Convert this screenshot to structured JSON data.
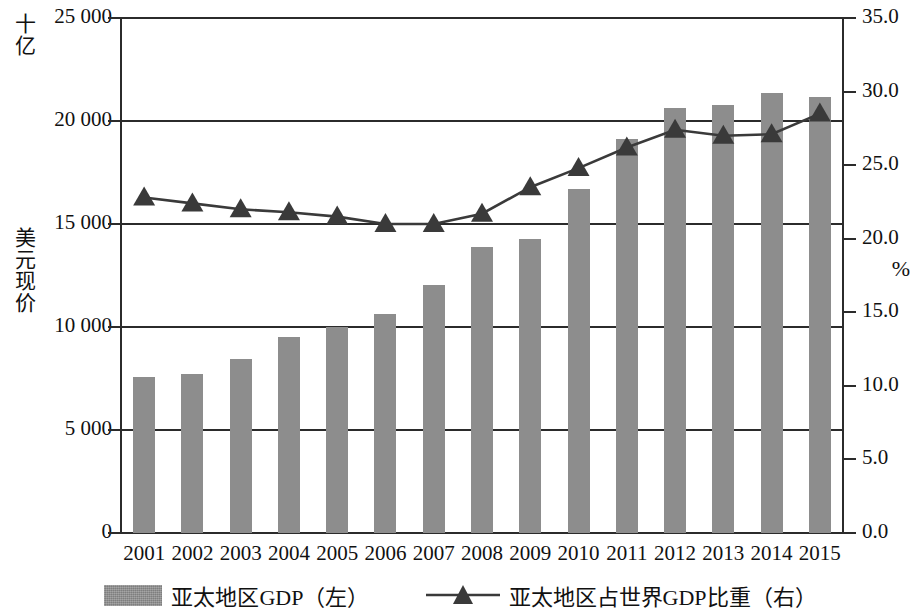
{
  "chart_data": {
    "type": "bar",
    "title": "",
    "xlabel": "",
    "categories": [
      "2001",
      "2002",
      "2003",
      "2004",
      "2005",
      "2006",
      "2007",
      "2008",
      "2009",
      "2010",
      "2011",
      "2012",
      "2013",
      "2014",
      "2015"
    ],
    "grid": true,
    "legend_position": "bottom",
    "left_axis": {
      "unit_top": "十亿",
      "unit_mid": "美元现价",
      "ylim": [
        0,
        25000
      ],
      "tick_values": [
        0,
        5000,
        10000,
        15000,
        20000,
        25000
      ],
      "tick_labels": [
        "0",
        "5 000",
        "10 000",
        "15 000",
        "20 000",
        "25 000"
      ]
    },
    "right_axis": {
      "unit": "%",
      "ylim": [
        0.0,
        35.0
      ],
      "tick_values": [
        0.0,
        5.0,
        10.0,
        15.0,
        20.0,
        25.0,
        30.0,
        35.0
      ],
      "tick_labels": [
        "0.0",
        "5.0",
        "10.0",
        "15.0",
        "20.0",
        "25.0",
        "30.0",
        "35.0"
      ]
    },
    "series": [
      {
        "name": "亚太地区GDP（左）",
        "type": "bar",
        "axis": "left",
        "color": "#8d8d8d",
        "values": [
          7570,
          7700,
          8450,
          9500,
          10000,
          10650,
          12050,
          13900,
          14250,
          16700,
          19150,
          20650,
          20800,
          21350,
          21150
        ]
      },
      {
        "name": "亚太地区占世界GDP比重（右）",
        "type": "line",
        "axis": "right",
        "marker": "triangle",
        "color": "#3a3a3a",
        "values": [
          22.8,
          22.4,
          22.0,
          21.8,
          21.5,
          21.0,
          21.0,
          21.7,
          23.5,
          24.8,
          26.2,
          27.4,
          27.0,
          27.1,
          28.5
        ]
      }
    ]
  },
  "legend": {
    "items": [
      {
        "label": "亚太地区GDP（左）",
        "swatch": "bar-swatch"
      },
      {
        "label": "亚太地区占世界GDP比重（右）",
        "swatch": "line-triangle-swatch"
      }
    ]
  }
}
